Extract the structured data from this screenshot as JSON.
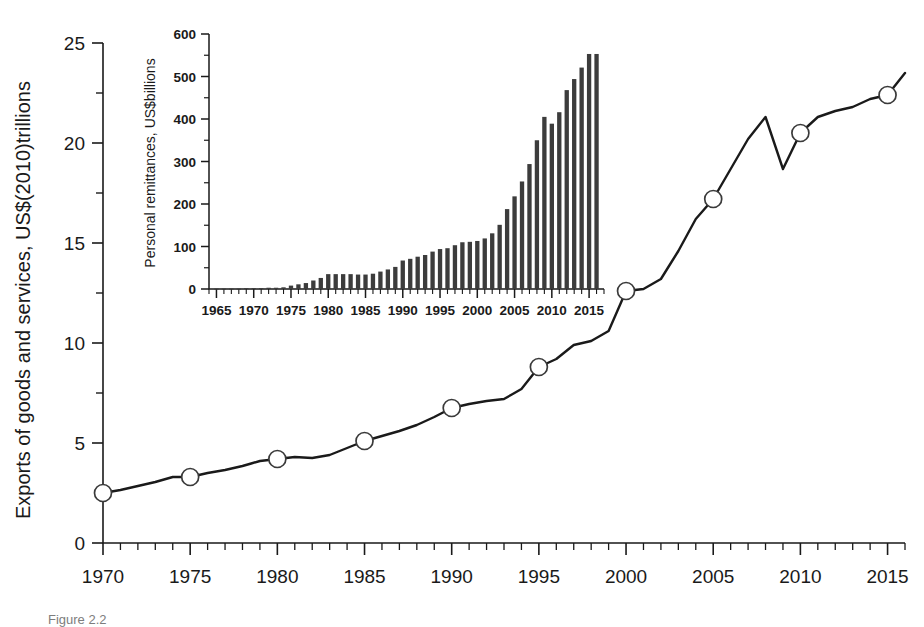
{
  "figure": {
    "caption": "Figure 2.2",
    "background": "#ffffff",
    "ink_color": "#1a1a1a",
    "bar_color": "#3c3c3c"
  },
  "chart_data": [
    {
      "id": "main",
      "type": "line",
      "title": "",
      "xlabel": "",
      "ylabel": "Exports of goods and services, US$(2010)trillions",
      "xlim": [
        1970,
        2016
      ],
      "ylim": [
        0,
        25
      ],
      "grid": false,
      "legend": "none",
      "x_ticks": [
        1970,
        1975,
        1980,
        1985,
        1990,
        1995,
        2000,
        2005,
        2010,
        2015
      ],
      "x_tick_labels": [
        "1970",
        "1975",
        "1980",
        "1985",
        "1990",
        "1995",
        "2000",
        "2005",
        "2010",
        "2015"
      ],
      "x_minor_step": 1,
      "y_ticks": [
        0,
        5,
        10,
        15,
        20,
        25
      ],
      "y_tick_labels": [
        "0",
        "5",
        "10",
        "15",
        "20",
        "25"
      ],
      "y_minor_step": 2.5,
      "marker_years": [
        1970,
        1975,
        1980,
        1985,
        1990,
        1995,
        2000,
        2005,
        2010,
        2015
      ],
      "x": [
        1970,
        1971,
        1972,
        1973,
        1974,
        1975,
        1976,
        1977,
        1978,
        1979,
        1980,
        1981,
        1982,
        1983,
        1984,
        1985,
        1986,
        1987,
        1988,
        1989,
        1990,
        1991,
        1992,
        1993,
        1994,
        1995,
        1996,
        1997,
        1998,
        1999,
        2000,
        2001,
        2002,
        2003,
        2004,
        2005,
        2006,
        2007,
        2008,
        2009,
        2010,
        2011,
        2012,
        2013,
        2014,
        2015,
        2016
      ],
      "values": [
        2.5,
        2.65,
        2.85,
        3.05,
        3.3,
        3.3,
        3.5,
        3.65,
        3.85,
        4.1,
        4.2,
        4.3,
        4.25,
        4.4,
        4.75,
        5.1,
        5.35,
        5.6,
        5.9,
        6.3,
        6.75,
        6.95,
        7.1,
        7.2,
        7.7,
        8.8,
        9.2,
        9.9,
        10.1,
        10.6,
        12.6,
        12.7,
        13.2,
        14.6,
        16.2,
        17.2,
        18.7,
        20.2,
        21.3,
        18.7,
        20.5,
        21.3,
        21.6,
        21.8,
        22.2,
        22.4,
        23.5
      ]
    },
    {
      "id": "inset",
      "type": "bar",
      "title": "",
      "xlabel": "",
      "ylabel": "Personal remittances, US$billions",
      "xlim": [
        1964,
        2017
      ],
      "ylim": [
        0,
        600
      ],
      "grid": false,
      "legend": "none",
      "x_ticks": [
        1965,
        1970,
        1975,
        1980,
        1985,
        1990,
        1995,
        2000,
        2005,
        2010,
        2015
      ],
      "x_tick_labels": [
        "1965",
        "1970",
        "1975",
        "1980",
        "1985",
        "1990",
        "1995",
        "2000",
        "2005",
        "2010",
        "2015"
      ],
      "x_minor_step": 1,
      "y_ticks": [
        0,
        100,
        200,
        300,
        400,
        500,
        600
      ],
      "y_tick_labels": [
        "0",
        "100",
        "200",
        "300",
        "400",
        "500",
        "600"
      ],
      "y_minor_step": 50,
      "categories": [
        1965,
        1966,
        1967,
        1968,
        1969,
        1970,
        1971,
        1972,
        1973,
        1974,
        1975,
        1976,
        1977,
        1978,
        1979,
        1980,
        1981,
        1982,
        1983,
        1984,
        1985,
        1986,
        1987,
        1988,
        1989,
        1990,
        1991,
        1992,
        1993,
        1994,
        1995,
        1996,
        1997,
        1998,
        1999,
        2000,
        2001,
        2002,
        2003,
        2004,
        2005,
        2006,
        2007,
        2008,
        2009,
        2010,
        2011,
        2012,
        2013,
        2014,
        2015,
        2016
      ],
      "values": [
        1,
        1,
        1,
        1,
        2,
        2,
        2,
        3,
        3,
        4,
        8,
        11,
        14,
        20,
        26,
        35,
        35,
        35,
        35,
        34,
        34,
        36,
        41,
        46,
        52,
        67,
        71,
        76,
        80,
        88,
        94,
        96,
        103,
        110,
        111,
        113,
        119,
        131,
        151,
        188,
        218,
        253,
        294,
        350,
        405,
        389,
        416,
        468,
        494,
        521,
        553,
        553,
        535
      ]
    }
  ],
  "main_axis": {
    "y_title": "Exports of goods and services, US$(2010)trillions",
    "y_tick_labels": [
      "0",
      "5",
      "10",
      "15",
      "20",
      "25"
    ],
    "x_tick_labels": [
      "1970",
      "1975",
      "1980",
      "1985",
      "1990",
      "1995",
      "2000",
      "2005",
      "2010",
      "2015"
    ]
  },
  "inset_axis": {
    "y_title": "Personal remittances, US$billions",
    "y_tick_labels": [
      "0",
      "100",
      "200",
      "300",
      "400",
      "500",
      "600"
    ],
    "x_tick_labels": [
      "1965",
      "1970",
      "1975",
      "1980",
      "1985",
      "1990",
      "1995",
      "2000",
      "2005",
      "2010",
      "2015"
    ]
  }
}
